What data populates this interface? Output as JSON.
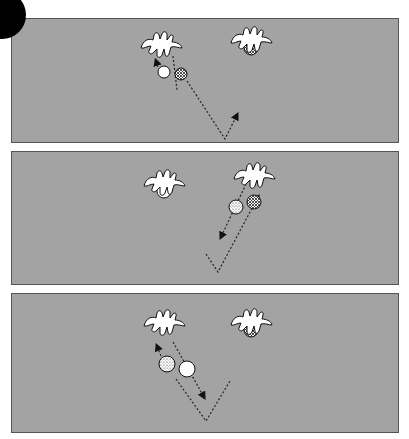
{
  "figure": {
    "badge_color": "#000000",
    "panel_color": "#a3a3a3",
    "border_color": "#555555",
    "panels": [
      {
        "id": 1,
        "top": 18,
        "height": 125,
        "hands": [
          {
            "name": "left-hand",
            "x": 160,
            "y": 45,
            "holding": null
          },
          {
            "name": "right-hand",
            "x": 250,
            "y": 40,
            "holding": "hatched"
          }
        ],
        "balls": [
          {
            "type": "white",
            "x": 163,
            "y": 71,
            "r": 6
          },
          {
            "type": "hatched",
            "x": 180,
            "y": 73,
            "r": 6
          }
        ],
        "paths": [
          {
            "d": "M172 55 L176 89",
            "arrow": null
          },
          {
            "d": "M186 80 L224 138 L236 114",
            "arrow": "end"
          },
          {
            "d": "M157 66 L155 60",
            "arrow": "end"
          }
        ]
      },
      {
        "id": 2,
        "top": 151,
        "height": 134,
        "hands": [
          {
            "name": "left-hand",
            "x": 163,
            "y": 183,
            "holding": "white"
          },
          {
            "name": "right-hand",
            "x": 253,
            "y": 176,
            "holding": null
          }
        ],
        "balls": [
          {
            "type": "dotted",
            "x": 235,
            "y": 206,
            "r": 7
          },
          {
            "type": "hatched",
            "x": 253,
            "y": 201,
            "r": 7
          }
        ],
        "paths": [
          {
            "d": "M245 183 L220 236",
            "arrow": "end"
          },
          {
            "d": "M205 253 L217 271 L257 196",
            "arrow": "end"
          }
        ]
      },
      {
        "id": 3,
        "top": 293,
        "height": 140,
        "hands": [
          {
            "name": "left-hand",
            "x": 163,
            "y": 323,
            "holding": null
          },
          {
            "name": "right-hand",
            "x": 250,
            "y": 322,
            "holding": "hatched"
          }
        ],
        "balls": [
          {
            "type": "dotted",
            "x": 166,
            "y": 363,
            "r": 8
          },
          {
            "type": "white",
            "x": 186,
            "y": 368,
            "r": 8
          }
        ],
        "paths": [
          {
            "d": "M172 341 L203 396",
            "arrow": "end"
          },
          {
            "d": "M160 355 L156 345",
            "arrow": "end"
          },
          {
            "d": "M175 378 L205 420 L229 380",
            "arrow": null
          }
        ]
      }
    ]
  }
}
